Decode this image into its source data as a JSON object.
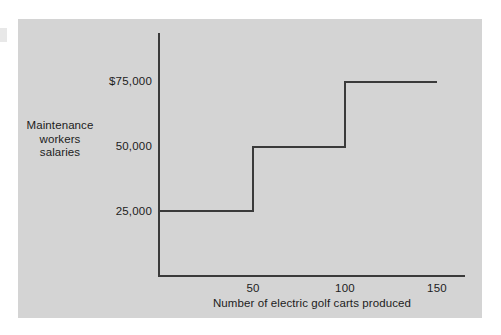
{
  "chart_data": {
    "type": "line",
    "subtype": "step",
    "title": "",
    "subtitle": "",
    "xlabel": "Number of electric golf carts produced",
    "ylabel": "Maintenance workers salaries",
    "ylabel_lines": [
      "Maintenance",
      "workers",
      "salaries"
    ],
    "x_tick_labels": [
      "50",
      "100",
      "150"
    ],
    "x_tick_values": [
      50,
      100,
      150
    ],
    "y_tick_labels": [
      "$75,000",
      "50,000",
      "25,000"
    ],
    "y_tick_values": [
      75000,
      50000,
      25000
    ],
    "xlim": [
      0,
      163
    ],
    "ylim": [
      0,
      96000
    ],
    "grid": false,
    "legend": false,
    "steps": [
      {
        "x_start": 0,
        "x_end": 50,
        "y": 25000,
        "y_label": "25,000"
      },
      {
        "x_start": 50,
        "x_end": 100,
        "y": 50000,
        "y_label": "50,000"
      },
      {
        "x_start": 100,
        "x_end": 150,
        "y": 75000,
        "y_label": "$75,000"
      }
    ],
    "x": [
      0,
      50,
      50,
      100,
      100,
      150
    ],
    "values": [
      25000,
      25000,
      50000,
      50000,
      75000,
      75000
    ]
  },
  "style": {
    "card_background": "#d4d4d4",
    "page_background": "#ffffff",
    "line_color": "#3a3a3a",
    "text_color": "#1c1c1c"
  }
}
